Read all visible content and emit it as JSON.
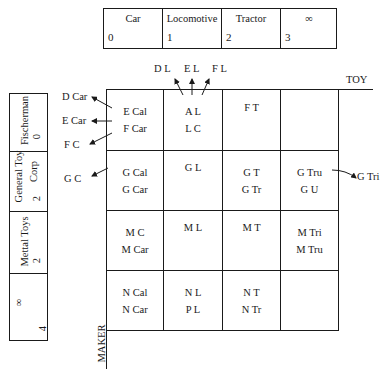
{
  "toy_attribute_table": {
    "columns": [
      {
        "label": "Car",
        "value": "0"
      },
      {
        "label": "Locomotive",
        "value": "1"
      },
      {
        "label": "Tractor",
        "value": "2"
      },
      {
        "label": "∞",
        "value": "3"
      }
    ]
  },
  "maker_attribute_table": {
    "rows": [
      {
        "label": "Fischerman",
        "value": "0"
      },
      {
        "label_line1": "General Toy",
        "label_line2": "Corp",
        "value": "2"
      },
      {
        "label": "Mettal Toys",
        "value": "2"
      },
      {
        "label": "∞",
        "value": "4"
      }
    ]
  },
  "axes": {
    "x_label": "TOY",
    "y_label": "MAKER"
  },
  "grid": {
    "rows": [
      [
        {
          "line1": "E Cal",
          "line2": "F Car"
        },
        {
          "line1": "A  L",
          "line2": "L  C"
        },
        {
          "line1": "F  T",
          "line2": ""
        },
        {
          "line1": "",
          "line2": ""
        }
      ],
      [
        {
          "line1": "G Cal",
          "line2": "G Car"
        },
        {
          "line1": "G  L",
          "line2": ""
        },
        {
          "line1": "G  T",
          "line2": "G  Tr"
        },
        {
          "line1": "G Tru",
          "line2": "G U"
        }
      ],
      [
        {
          "line1": "M C",
          "line2": "M Car"
        },
        {
          "line1": "M  L",
          "line2": ""
        },
        {
          "line1": "M  T",
          "line2": ""
        },
        {
          "line1": "M Tri",
          "line2": "M Tru"
        }
      ],
      [
        {
          "line1": "N Cal",
          "line2": "N Car"
        },
        {
          "line1": "N  L",
          "line2": "P  L"
        },
        {
          "line1": "N  T",
          "line2": "N Tr"
        },
        {
          "line1": "",
          "line2": ""
        }
      ]
    ]
  },
  "overflow_labels": {
    "top": [
      "D  L",
      "E  L",
      "F  L"
    ],
    "left": [
      "D Car",
      "E Car",
      "F  C",
      "G  C"
    ],
    "right": [
      "G Tri"
    ]
  }
}
